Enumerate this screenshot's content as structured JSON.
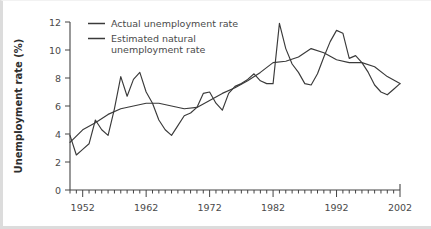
{
  "chart_data": {
    "type": "line",
    "title": "",
    "xlabel": "",
    "ylabel": "Unemployment rate (%)",
    "xlim": [
      1950,
      2002
    ],
    "ylim": [
      0,
      12
    ],
    "yticks": [
      0,
      2,
      4,
      6,
      8,
      10,
      12
    ],
    "ytick_labels": [
      "0",
      "2",
      "4",
      "6",
      "8",
      "10",
      "12"
    ],
    "xticks": [
      1952,
      1962,
      1972,
      1982,
      1992,
      2002
    ],
    "xtick_labels": [
      "1952",
      "1962",
      "1972",
      "1982",
      "1992",
      "2002"
    ],
    "x_minor_tick_interval": 1,
    "grid": false,
    "legend_position": "top-left",
    "series": [
      {
        "name": "Actual unemployment rate",
        "color": "#3a3a3a",
        "x": [
          1950,
          1951,
          1952,
          1953,
          1954,
          1955,
          1956,
          1957,
          1958,
          1959,
          1960,
          1961,
          1962,
          1963,
          1964,
          1965,
          1966,
          1967,
          1968,
          1969,
          1970,
          1971,
          1972,
          1973,
          1974,
          1975,
          1976,
          1977,
          1978,
          1979,
          1980,
          1981,
          1982,
          1983,
          1984,
          1985,
          1986,
          1987,
          1988,
          1989,
          1990,
          1991,
          1992,
          1993,
          1994,
          1995,
          1996,
          1997,
          1998,
          1999,
          2000,
          2001,
          2002
        ],
        "values": [
          3.9,
          2.5,
          2.9,
          3.3,
          5.0,
          4.3,
          3.9,
          5.8,
          8.1,
          6.7,
          7.9,
          8.4,
          7.0,
          6.2,
          5.0,
          4.3,
          3.9,
          4.6,
          5.3,
          5.5,
          5.9,
          6.9,
          7.0,
          6.2,
          5.7,
          6.9,
          7.4,
          7.6,
          7.9,
          8.3,
          7.8,
          7.6,
          7.6,
          11.9,
          10.1,
          9.0,
          8.4,
          7.6,
          7.5,
          8.3,
          9.5,
          10.6,
          11.4,
          11.2,
          9.4,
          9.6,
          9.1,
          8.4,
          7.5,
          7.0,
          6.8,
          7.2,
          7.6
        ]
      },
      {
        "name": "Estimated natural unemployment rate",
        "color": "#3a3a3a",
        "x": [
          1950,
          1952,
          1954,
          1956,
          1958,
          1960,
          1962,
          1964,
          1966,
          1968,
          1970,
          1972,
          1974,
          1976,
          1978,
          1980,
          1982,
          1984,
          1986,
          1988,
          1990,
          1992,
          1994,
          1996,
          1998,
          2000,
          2002
        ],
        "values": [
          3.4,
          4.3,
          4.8,
          5.4,
          5.8,
          6.0,
          6.2,
          6.2,
          6.0,
          5.8,
          5.9,
          6.4,
          6.9,
          7.3,
          7.8,
          8.4,
          9.1,
          9.2,
          9.5,
          10.1,
          9.8,
          9.3,
          9.1,
          9.1,
          8.8,
          8.1,
          7.6
        ]
      }
    ]
  },
  "legend": {
    "entries": [
      {
        "label": "Actual unemployment rate",
        "label_line2": ""
      },
      {
        "label": "Estimated natural",
        "label_line2": "unemployment rate"
      }
    ]
  }
}
